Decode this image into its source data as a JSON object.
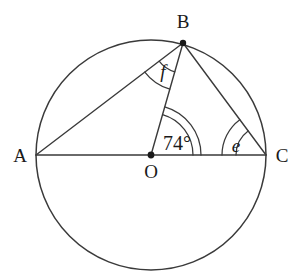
{
  "figure": {
    "background_color": "#ffffff",
    "stroke_color": "#3a3a3a",
    "text_color": "#1a1a1a"
  },
  "circle": {
    "center_label": "O",
    "cx": 151,
    "cy": 155,
    "r": 115
  },
  "points": [
    {
      "id": "A",
      "label": "A",
      "x": 36,
      "y": 155,
      "label_x": 20,
      "label_y": 162,
      "has_dot": false
    },
    {
      "id": "B",
      "label": "B",
      "x": 183,
      "y": 43,
      "label_x": 183,
      "label_y": 28,
      "has_dot": true
    },
    {
      "id": "C",
      "label": "C",
      "x": 266,
      "y": 155,
      "label_x": 282,
      "label_y": 162,
      "has_dot": false
    },
    {
      "id": "O",
      "label": "O",
      "x": 151,
      "y": 155,
      "label_x": 151,
      "label_y": 178,
      "has_dot": true
    }
  ],
  "segments": [
    {
      "id": "AC",
      "from": "A",
      "to": "C",
      "description": "diameter A to C through O"
    },
    {
      "id": "AB",
      "from": "A",
      "to": "B",
      "description": "chord A to B"
    },
    {
      "id": "BO",
      "from": "B",
      "to": "O",
      "description": "radius B to O"
    },
    {
      "id": "BC",
      "from": "B",
      "to": "C",
      "description": "chord B to C"
    }
  ],
  "angles": [
    {
      "id": "angle-boc",
      "label": "74°",
      "value": 74,
      "unit": "degrees",
      "vertex": "O",
      "style": "normal",
      "arc_radii": [
        42,
        50
      ],
      "label_x": 177,
      "label_y": 150,
      "between": [
        "BO",
        "OC"
      ]
    },
    {
      "id": "angle-bco",
      "label": "e",
      "value": null,
      "unit": "degrees",
      "vertex": "C",
      "style": "italic",
      "arc_radii": [
        30,
        44
      ],
      "label_x": 236,
      "label_y": 152,
      "between": [
        "CB",
        "CO"
      ]
    },
    {
      "id": "angle-abo",
      "label": "f",
      "value": null,
      "unit": "degrees",
      "vertex": "B",
      "style": "italic",
      "arc_radii": [
        30,
        48
      ],
      "label_x": 163,
      "label_y": 78,
      "between": [
        "BA",
        "BO"
      ]
    }
  ]
}
